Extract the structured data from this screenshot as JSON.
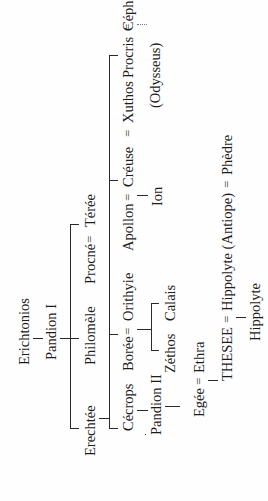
{
  "diagram": {
    "type": "genealogy-tree",
    "orientation": "rotated-90-ccw",
    "root": "Erichtonios",
    "gen1": "Pandion I",
    "gen2": [
      "Erechtée",
      "Philomèle",
      "Procné",
      "Térée"
    ],
    "gen3": {
      "cecrops": "Cécrops",
      "boree": "Borée",
      "orithyie": "Orithyie",
      "apollon": "Apollon",
      "creuse": "Créuse",
      "xuthos": "Xuthos",
      "procris": "Procris",
      "cephale": "Céphale"
    },
    "gen4": {
      "pandion2": "Pandion II",
      "zethos": "Zéthos",
      "calais": "Calais",
      "ion": "Ion",
      "odysseus": "(Odysseus)"
    },
    "gen5": {
      "egee": "Egée",
      "ethra": "Ethra"
    },
    "gen6": {
      "thesee": "THESEE",
      "hippolyte_antiope": "Hippolyte (Antiope)",
      "phedre": "Phèdre"
    },
    "gen7": {
      "hippolyte": "Hippolyte"
    },
    "marriage_symbol": "="
  }
}
